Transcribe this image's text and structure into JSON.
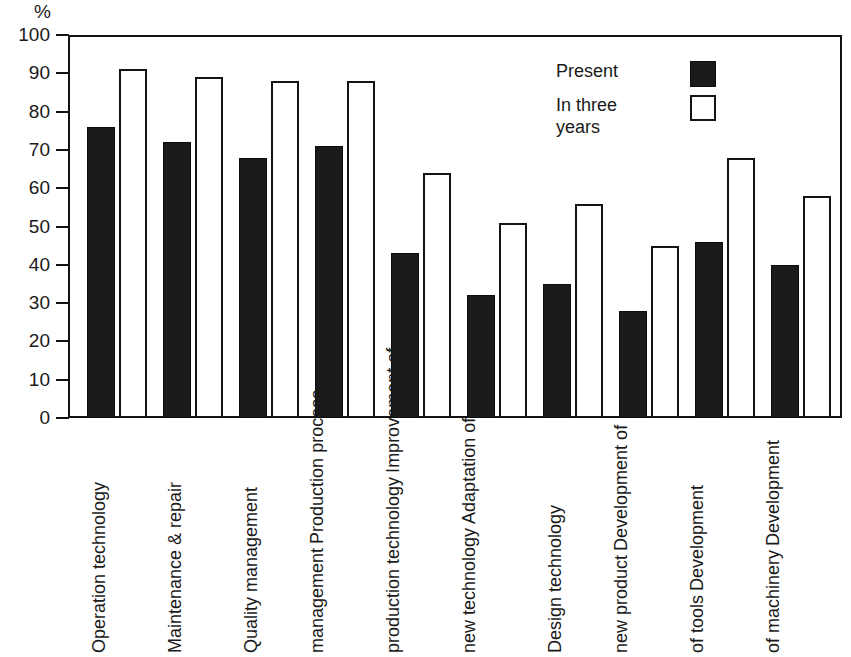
{
  "axis": {
    "unit_label": "%",
    "y_ticks": [
      0,
      10,
      20,
      30,
      40,
      50,
      60,
      70,
      80,
      90,
      100
    ]
  },
  "legend": {
    "present_label": "Present",
    "future_label_line1": "In three",
    "future_label_line2": "years",
    "present_swatch": "filled-black-square",
    "future_swatch": "hollow-white-square"
  },
  "colors": {
    "present": "#1a1a1a",
    "future": "#ffffff",
    "outline": "#141414",
    "background": "#ffffff"
  },
  "categories_lines": [
    [
      "Operation technology"
    ],
    [
      "Maintenance & repair"
    ],
    [
      "Quality management"
    ],
    [
      "Production process",
      "management"
    ],
    [
      "Improvement of",
      "production technology"
    ],
    [
      "Adaptation of",
      "new technology"
    ],
    [
      "Design technology"
    ],
    [
      "Development of",
      "new product"
    ],
    [
      "Development",
      "of tools"
    ],
    [
      "Development",
      "of machinery"
    ]
  ],
  "chart_data": {
    "type": "bar",
    "title": "",
    "xlabel": "",
    "ylabel": "%",
    "ylim": [
      0,
      100
    ],
    "yticks": [
      0,
      10,
      20,
      30,
      40,
      50,
      60,
      70,
      80,
      90,
      100
    ],
    "grid": false,
    "legend_position": "top-right",
    "categories": [
      "Operation technology",
      "Maintenance & repair",
      "Quality management",
      "Production process management",
      "Improvement of production technology",
      "Adaptation of new technology",
      "Design technology",
      "Development of new product",
      "Development of tools",
      "Development of machinery"
    ],
    "series": [
      {
        "name": "Present",
        "color": "#1a1a1a",
        "values": [
          76,
          72,
          68,
          71,
          43,
          32,
          35,
          28,
          46,
          40
        ]
      },
      {
        "name": "In three years",
        "color": "#ffffff",
        "values": [
          91,
          89,
          88,
          88,
          64,
          51,
          56,
          45,
          68,
          58
        ]
      }
    ]
  }
}
